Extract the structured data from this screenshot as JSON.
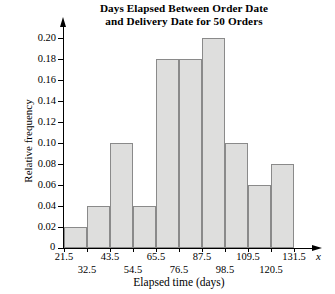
{
  "chart_data": {
    "type": "bar",
    "title": "Days Elapsed Between Order Date and Delivery Date for 50 Orders",
    "title_lines": [
      "Days Elapsed Between Order Date",
      "and Delivery Date for 50 Orders"
    ],
    "xlabel": "Elapsed time (days)",
    "ylabel": "Relative frequency",
    "x_variable_symbol": "x",
    "origin_label": "0",
    "grid": false,
    "legend": false,
    "ylim": [
      0,
      0.2
    ],
    "xlim": [
      21.5,
      131.5
    ],
    "y_ticks": [
      0,
      0.02,
      0.04,
      0.06,
      0.08,
      0.1,
      0.12,
      0.14,
      0.16,
      0.18,
      0.2
    ],
    "y_tick_labels": [
      "0",
      "0.02",
      "0.04",
      "0.06",
      "0.08",
      "0.10",
      "0.12",
      "0.14",
      "0.16",
      "0.18",
      "0.20"
    ],
    "bin_edges": [
      21.5,
      32.5,
      43.5,
      54.5,
      65.5,
      76.5,
      87.5,
      98.5,
      109.5,
      120.5,
      131.5
    ],
    "bin_edge_labels": [
      "21.5",
      "32.5",
      "43.5",
      "54.5",
      "65.5",
      "76.5",
      "87.5",
      "98.5",
      "109.5",
      "120.5",
      "131.5"
    ],
    "bin_label_rows": [
      0,
      1,
      0,
      1,
      0,
      1,
      0,
      1,
      0,
      1,
      0
    ],
    "bin_width": 11,
    "categories": [
      "21.5-32.5",
      "32.5-43.5",
      "43.5-54.5",
      "54.5-65.5",
      "65.5-76.5",
      "76.5-87.5",
      "87.5-98.5",
      "98.5-109.5",
      "109.5-120.5",
      "120.5-131.5"
    ],
    "values": [
      0.02,
      0.04,
      0.1,
      0.04,
      0.18,
      0.18,
      0.2,
      0.1,
      0.06,
      0.08
    ],
    "bar_fill_color": "#dededd",
    "bar_border_color": "#8a8a8a",
    "axis_color": "#000000"
  }
}
